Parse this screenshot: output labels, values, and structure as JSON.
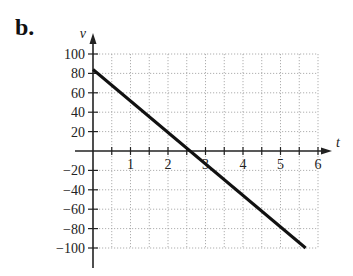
{
  "figure": {
    "label": "b."
  },
  "chart_data": {
    "type": "line",
    "title": "",
    "xlabel": "t",
    "ylabel": "v",
    "xlim": [
      0,
      6
    ],
    "ylim": [
      -100,
      100
    ],
    "grid": true,
    "grid_style": "dotted",
    "x_ticks": [
      0.5,
      1,
      1.5,
      2,
      2.5,
      3,
      3.5,
      4,
      4.5,
      5,
      5.5,
      6
    ],
    "x_tick_labels": [
      "1",
      "2",
      "3",
      "4",
      "5",
      "6"
    ],
    "x_tick_label_values": [
      1,
      2,
      3,
      4,
      5,
      6
    ],
    "y_ticks": [
      100,
      80,
      60,
      40,
      20,
      -20,
      -40,
      -60,
      -80,
      -100
    ],
    "y_tick_labels": [
      "100",
      "80",
      "60",
      "40",
      "20",
      "−20",
      "−40",
      "−60",
      "−80",
      "−100"
    ],
    "series": [
      {
        "name": "v(t)",
        "color": "#111111",
        "x": [
          0,
          5.67
        ],
        "values": [
          84,
          -100
        ]
      }
    ]
  }
}
